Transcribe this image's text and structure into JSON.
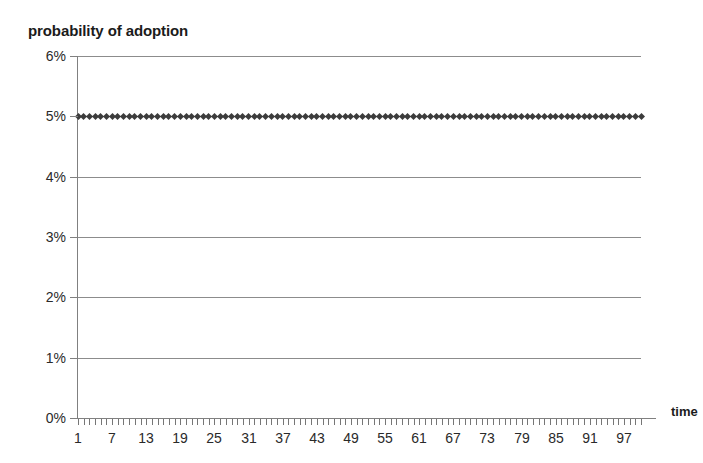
{
  "chart_data": {
    "type": "line",
    "title": "probability of adoption",
    "xlabel": "time",
    "ylabel": "",
    "marker": "diamond",
    "marker_color": "#3c3c3c",
    "line_color": "#3a3a3a",
    "grid": true,
    "grid_axis": "y",
    "legend": false,
    "background_color": "#ffffff",
    "xlim": [
      1,
      100
    ],
    "ylim": [
      0,
      0.06
    ],
    "y_tick_labels": [
      "0%",
      "1%",
      "2%",
      "3%",
      "4%",
      "5%",
      "6%"
    ],
    "y_tick_values": [
      0,
      0.01,
      0.02,
      0.03,
      0.04,
      0.05,
      0.06
    ],
    "x_tick_labels": [
      "1",
      "7",
      "13",
      "19",
      "25",
      "31",
      "37",
      "43",
      "49",
      "55",
      "61",
      "67",
      "73",
      "79",
      "85",
      "91",
      "97"
    ],
    "x_tick_values": [
      1,
      7,
      13,
      19,
      25,
      31,
      37,
      43,
      49,
      55,
      61,
      67,
      73,
      79,
      85,
      91,
      97
    ],
    "x_minor_tick_step": 1,
    "series": [
      {
        "name": "probability of adoption",
        "constant_value": 0.05,
        "n_points": 100,
        "x_start": 1,
        "x_step": 1,
        "values": [
          0.05,
          0.05,
          0.05,
          0.05,
          0.05,
          0.05,
          0.05,
          0.05,
          0.05,
          0.05,
          0.05,
          0.05,
          0.05,
          0.05,
          0.05,
          0.05,
          0.05,
          0.05,
          0.05,
          0.05,
          0.05,
          0.05,
          0.05,
          0.05,
          0.05,
          0.05,
          0.05,
          0.05,
          0.05,
          0.05,
          0.05,
          0.05,
          0.05,
          0.05,
          0.05,
          0.05,
          0.05,
          0.05,
          0.05,
          0.05,
          0.05,
          0.05,
          0.05,
          0.05,
          0.05,
          0.05,
          0.05,
          0.05,
          0.05,
          0.05,
          0.05,
          0.05,
          0.05,
          0.05,
          0.05,
          0.05,
          0.05,
          0.05,
          0.05,
          0.05,
          0.05,
          0.05,
          0.05,
          0.05,
          0.05,
          0.05,
          0.05,
          0.05,
          0.05,
          0.05,
          0.05,
          0.05,
          0.05,
          0.05,
          0.05,
          0.05,
          0.05,
          0.05,
          0.05,
          0.05,
          0.05,
          0.05,
          0.05,
          0.05,
          0.05,
          0.05,
          0.05,
          0.05,
          0.05,
          0.05,
          0.05,
          0.05,
          0.05,
          0.05,
          0.05,
          0.05,
          0.05,
          0.05,
          0.05,
          0.05
        ]
      }
    ]
  }
}
